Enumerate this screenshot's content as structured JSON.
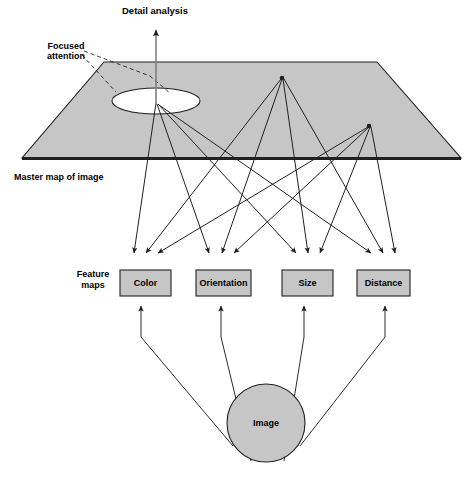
{
  "figure": {
    "type": "diagram",
    "background_color": "#ffffff",
    "line_color": "#231f20",
    "fill_gray": "#c6c6c6"
  },
  "labels": {
    "detail_analysis": "Detail analysis",
    "focused_attention_line1": "Focused",
    "focused_attention_line2": "attention",
    "master_map": "Master map of image",
    "feature_maps_line1": "Feature",
    "feature_maps_line2": "maps",
    "image": "Image"
  },
  "feature_maps": [
    {
      "label": "Color",
      "x": 120,
      "y": 270,
      "w": 51,
      "h": 26
    },
    {
      "label": "Orientation",
      "x": 196,
      "y": 270,
      "w": 55,
      "h": 26
    },
    {
      "label": "Size",
      "x": 282,
      "y": 270,
      "w": 51,
      "h": 26
    },
    {
      "label": "Distance",
      "x": 357,
      "y": 270,
      "w": 53,
      "h": 26
    }
  ],
  "master_map_plane": {
    "top_left": [
      104,
      62
    ],
    "top_right": [
      377,
      62
    ],
    "bottom_right": [
      461,
      158
    ],
    "bottom_left": [
      22,
      158
    ]
  },
  "focus_ellipse": {
    "cx": 156,
    "cy": 101,
    "rx": 44,
    "ry": 13
  },
  "convergence_points": [
    {
      "name": "focused-attention-node",
      "x": 156,
      "y": 103
    },
    {
      "name": "mid-node",
      "x": 282,
      "y": 78
    },
    {
      "name": "right-node",
      "x": 369,
      "y": 126
    }
  ],
  "image_node": {
    "cx": 266,
    "cy": 423,
    "r": 39
  },
  "detail_analysis_arrow": {
    "from": [
      156,
      103
    ],
    "to": [
      156,
      28
    ]
  }
}
